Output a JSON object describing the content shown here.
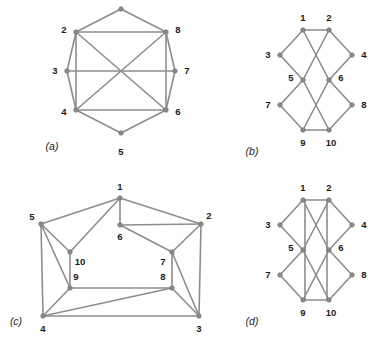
{
  "figure": {
    "background_color": "#ffffff",
    "edge_color": "#8d8d8d",
    "node_color": "#8a8a8a",
    "label_color": "#1b1b1b"
  },
  "panels": [
    {
      "id": "a",
      "label": "(a)",
      "label_pos": [
        52,
        147
      ],
      "description": "Octagon with chords",
      "nodes": [
        {
          "id": "1",
          "x": 121,
          "y": 9,
          "label": "",
          "lx": 121,
          "ly": 9
        },
        {
          "id": "2",
          "x": 76,
          "y": 32,
          "label": "2",
          "lx": 64,
          "ly": 30
        },
        {
          "id": "3",
          "x": 67,
          "y": 71,
          "label": "3",
          "lx": 55,
          "ly": 71
        },
        {
          "id": "4",
          "x": 76,
          "y": 110,
          "label": "4",
          "lx": 64,
          "ly": 112
        },
        {
          "id": "5",
          "x": 121,
          "y": 133,
          "label": "5",
          "lx": 121,
          "ly": 152
        },
        {
          "id": "6",
          "x": 166,
          "y": 110,
          "label": "6",
          "lx": 178,
          "ly": 112
        },
        {
          "id": "7",
          "x": 175,
          "y": 71,
          "label": "7",
          "lx": 187,
          "ly": 71
        },
        {
          "id": "8",
          "x": 166,
          "y": 32,
          "label": "8",
          "lx": 178,
          "ly": 30
        }
      ],
      "edges": [
        [
          "1",
          "2"
        ],
        [
          "2",
          "3"
        ],
        [
          "3",
          "4"
        ],
        [
          "4",
          "5"
        ],
        [
          "5",
          "6"
        ],
        [
          "6",
          "7"
        ],
        [
          "7",
          "8"
        ],
        [
          "8",
          "1"
        ],
        [
          "2",
          "8"
        ],
        [
          "4",
          "6"
        ],
        [
          "3",
          "7"
        ],
        [
          "2",
          "4"
        ],
        [
          "6",
          "8"
        ],
        [
          "2",
          "6"
        ],
        [
          "4",
          "8"
        ]
      ]
    },
    {
      "id": "b",
      "label": "(b)",
      "label_pos": [
        252,
        152
      ],
      "description": "Bipartite-style drawing with crossings",
      "nodes": [
        {
          "id": "1",
          "x": 303,
          "y": 30,
          "label": "1",
          "lx": 303,
          "ly": 18
        },
        {
          "id": "2",
          "x": 329,
          "y": 30,
          "label": "2",
          "lx": 329,
          "ly": 18
        },
        {
          "id": "3",
          "x": 280,
          "y": 55,
          "label": "3",
          "lx": 268,
          "ly": 55
        },
        {
          "id": "4",
          "x": 352,
          "y": 55,
          "label": "4",
          "lx": 364,
          "ly": 55
        },
        {
          "id": "5",
          "x": 303,
          "y": 80,
          "label": "5",
          "lx": 291,
          "ly": 78
        },
        {
          "id": "6",
          "x": 329,
          "y": 80,
          "label": "6",
          "lx": 341,
          "ly": 78
        },
        {
          "id": "7",
          "x": 280,
          "y": 105,
          "label": "7",
          "lx": 268,
          "ly": 105
        },
        {
          "id": "8",
          "x": 352,
          "y": 105,
          "label": "8",
          "lx": 364,
          "ly": 105
        },
        {
          "id": "9",
          "x": 303,
          "y": 130,
          "label": "9",
          "lx": 303,
          "ly": 143
        },
        {
          "id": "10",
          "x": 329,
          "y": 130,
          "label": "10",
          "lx": 331,
          "ly": 143
        }
      ],
      "edges": [
        [
          "1",
          "2"
        ],
        [
          "1",
          "3"
        ],
        [
          "2",
          "4"
        ],
        [
          "3",
          "5"
        ],
        [
          "4",
          "6"
        ],
        [
          "1",
          "6"
        ],
        [
          "2",
          "5"
        ],
        [
          "5",
          "7"
        ],
        [
          "6",
          "8"
        ],
        [
          "7",
          "9"
        ],
        [
          "8",
          "10"
        ],
        [
          "5",
          "10"
        ],
        [
          "6",
          "9"
        ],
        [
          "9",
          "10"
        ]
      ]
    },
    {
      "id": "c",
      "label": "(c)",
      "label_pos": [
        16,
        322
      ],
      "description": "Planar drawing",
      "nodes": [
        {
          "id": "1",
          "x": 120,
          "y": 198,
          "label": "1",
          "lx": 120,
          "ly": 187
        },
        {
          "id": "2",
          "x": 201,
          "y": 224,
          "label": "2",
          "lx": 209,
          "ly": 216
        },
        {
          "id": "3",
          "x": 199,
          "y": 316,
          "label": "3",
          "lx": 199,
          "ly": 329
        },
        {
          "id": "4",
          "x": 43,
          "y": 316,
          "label": "4",
          "lx": 43,
          "ly": 329
        },
        {
          "id": "5",
          "x": 41,
          "y": 224,
          "label": "5",
          "lx": 32,
          "ly": 217
        },
        {
          "id": "6",
          "x": 120,
          "y": 225,
          "label": "6",
          "lx": 120,
          "ly": 237
        },
        {
          "id": "7",
          "x": 172,
          "y": 252,
          "label": "7",
          "lx": 163,
          "ly": 262
        },
        {
          "id": "8",
          "x": 172,
          "y": 288,
          "label": "8",
          "lx": 163,
          "ly": 277
        },
        {
          "id": "9",
          "x": 70,
          "y": 288,
          "label": "9",
          "lx": 76,
          "ly": 277
        },
        {
          "id": "10",
          "x": 70,
          "y": 252,
          "label": "10",
          "lx": 80,
          "ly": 262
        }
      ],
      "edges": [
        [
          "1",
          "5"
        ],
        [
          "1",
          "2"
        ],
        [
          "1",
          "6"
        ],
        [
          "1",
          "10"
        ],
        [
          "5",
          "10"
        ],
        [
          "5",
          "9"
        ],
        [
          "5",
          "4"
        ],
        [
          "2",
          "6"
        ],
        [
          "2",
          "7"
        ],
        [
          "2",
          "3"
        ],
        [
          "6",
          "7"
        ],
        [
          "10",
          "9"
        ],
        [
          "9",
          "4"
        ],
        [
          "9",
          "8"
        ],
        [
          "7",
          "8"
        ],
        [
          "7",
          "3"
        ],
        [
          "8",
          "3"
        ],
        [
          "8",
          "4"
        ],
        [
          "4",
          "3"
        ]
      ]
    },
    {
      "id": "d",
      "label": "(d)",
      "label_pos": [
        252,
        322
      ],
      "description": "Same as (b) plus two near-vertical edges",
      "nodes": [
        {
          "id": "1",
          "x": 303,
          "y": 200,
          "label": "1",
          "lx": 303,
          "ly": 188
        },
        {
          "id": "2",
          "x": 329,
          "y": 200,
          "label": "2",
          "lx": 329,
          "ly": 188
        },
        {
          "id": "3",
          "x": 280,
          "y": 225,
          "label": "3",
          "lx": 268,
          "ly": 225
        },
        {
          "id": "4",
          "x": 352,
          "y": 225,
          "label": "4",
          "lx": 364,
          "ly": 225
        },
        {
          "id": "5",
          "x": 303,
          "y": 250,
          "label": "5",
          "lx": 291,
          "ly": 248
        },
        {
          "id": "6",
          "x": 329,
          "y": 250,
          "label": "6",
          "lx": 341,
          "ly": 248
        },
        {
          "id": "7",
          "x": 280,
          "y": 275,
          "label": "7",
          "lx": 268,
          "ly": 275
        },
        {
          "id": "8",
          "x": 352,
          "y": 275,
          "label": "8",
          "lx": 364,
          "ly": 275
        },
        {
          "id": "9",
          "x": 303,
          "y": 300,
          "label": "9",
          "lx": 303,
          "ly": 313
        },
        {
          "id": "10",
          "x": 329,
          "y": 300,
          "label": "10",
          "lx": 331,
          "ly": 313
        }
      ],
      "edges": [
        [
          "1",
          "2"
        ],
        [
          "1",
          "3"
        ],
        [
          "2",
          "4"
        ],
        [
          "3",
          "5"
        ],
        [
          "4",
          "6"
        ],
        [
          "1",
          "6"
        ],
        [
          "2",
          "5"
        ],
        [
          "5",
          "7"
        ],
        [
          "6",
          "8"
        ],
        [
          "7",
          "9"
        ],
        [
          "8",
          "10"
        ],
        [
          "5",
          "10"
        ],
        [
          "6",
          "9"
        ],
        [
          "9",
          "10"
        ]
      ],
      "straight_edges": [
        {
          "from": "1",
          "to": "9",
          "offset_x": 2
        },
        {
          "from": "2",
          "to": "10",
          "offset_x": -2
        }
      ]
    }
  ]
}
